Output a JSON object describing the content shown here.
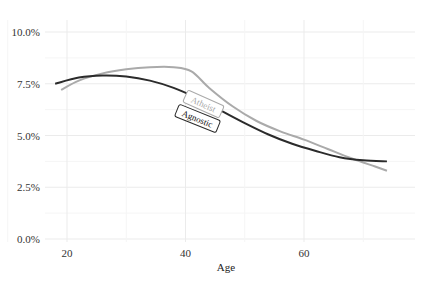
{
  "chart_data": {
    "type": "line",
    "title": "",
    "xlabel": "Age",
    "ylabel": "",
    "xlim": [
      16,
      77
    ],
    "ylim": [
      0,
      10.5
    ],
    "x_ticks": [
      20,
      40,
      60
    ],
    "x_tick_labels": [
      "20",
      "40",
      "60"
    ],
    "y_ticks": [
      0,
      2.5,
      5,
      7.5,
      10
    ],
    "y_tick_labels": [
      "0.0%",
      "2.5%",
      "5.0%",
      "7.5%",
      "10.0%"
    ],
    "grid": true,
    "legend": "inline labels",
    "series": [
      {
        "name": "Agnostic",
        "color": "#2b2b2b",
        "x": [
          18,
          22,
          26,
          30,
          34,
          38,
          42,
          46,
          50,
          54,
          58,
          62,
          66,
          70,
          74
        ],
        "values": [
          7.5,
          7.8,
          7.9,
          7.85,
          7.65,
          7.3,
          6.8,
          6.2,
          5.6,
          5.05,
          4.6,
          4.25,
          3.95,
          3.8,
          3.75
        ]
      },
      {
        "name": "Atheist",
        "color": "#aaaaaa",
        "x": [
          19,
          22,
          26,
          30,
          34,
          38,
          41,
          44,
          48,
          52,
          56,
          60,
          64,
          68,
          72,
          74
        ],
        "values": [
          7.2,
          7.65,
          8.0,
          8.2,
          8.3,
          8.3,
          8.1,
          7.3,
          6.4,
          5.7,
          5.2,
          4.8,
          4.35,
          3.9,
          3.5,
          3.3
        ]
      }
    ],
    "annotations": [
      {
        "text": "Atheist",
        "x": 43,
        "y": 6.5
      },
      {
        "text": "Agnostic",
        "x": 42,
        "y": 5.8
      }
    ]
  }
}
